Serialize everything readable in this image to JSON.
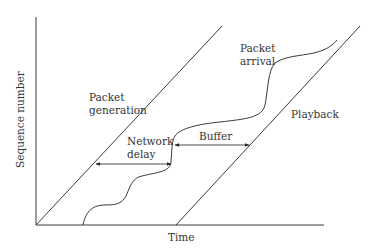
{
  "diagram": {
    "axes": {
      "x_label": "Time",
      "y_label": "Sequence number"
    },
    "curves": {
      "generation": {
        "label_line1": "Packet",
        "label_line2": "generation"
      },
      "arrival": {
        "label_line1": "Packet",
        "label_line2": "arrival"
      },
      "playback": {
        "label": "Playback"
      }
    },
    "arrows": {
      "network_delay": {
        "label_line1": "Network",
        "label_line2": "delay"
      },
      "buffer": {
        "label": "Buffer"
      }
    },
    "colors": {
      "stroke": "#3a3a3a",
      "text": "#333333",
      "background": "#ffffff"
    }
  }
}
